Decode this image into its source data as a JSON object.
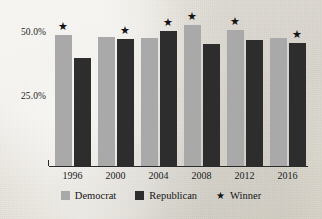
{
  "chart_data": {
    "type": "bar",
    "title": "",
    "subtitle": "",
    "xlabel": "",
    "ylabel": "",
    "categories": [
      "1996",
      "2000",
      "2004",
      "2008",
      "2012",
      "2016"
    ],
    "series": [
      {
        "name": "Democrat",
        "color": "#a9a9a9",
        "values": [
          49.2,
          48.4,
          48.3,
          52.9,
          51.1,
          48.2
        ]
      },
      {
        "name": "Republican",
        "color": "#2d2d2d",
        "values": [
          40.7,
          47.9,
          50.7,
          45.7,
          47.2,
          46.1
        ]
      }
    ],
    "winners": [
      "Democrat",
      "Republican",
      "Republican",
      "Democrat",
      "Democrat",
      "Republican"
    ],
    "winner_marker": "★",
    "ylim": [
      0,
      55
    ],
    "yticks": [
      25.0,
      50.0
    ],
    "ytick_labels": [
      "25.0%",
      "50.0%"
    ],
    "grid": false,
    "legend_position": "bottom"
  },
  "legend": {
    "items": [
      {
        "label": "Democrat",
        "marker": "swatch",
        "color": "#a9a9a9"
      },
      {
        "label": "Republican",
        "marker": "swatch",
        "color": "#2d2d2d"
      },
      {
        "label": "Winner",
        "marker": "star",
        "glyph": "★"
      }
    ]
  },
  "axis": {
    "y_labels": [
      "50.0%",
      "25.0%"
    ],
    "x_labels": [
      "1996",
      "2000",
      "2004",
      "2008",
      "2012",
      "2016"
    ]
  },
  "colors": {
    "democrat": "#a9a9a9",
    "republican": "#2d2d2d",
    "axis": "#2a2a2a",
    "text": "#1b1b1b",
    "paper": "#e9e6df"
  }
}
